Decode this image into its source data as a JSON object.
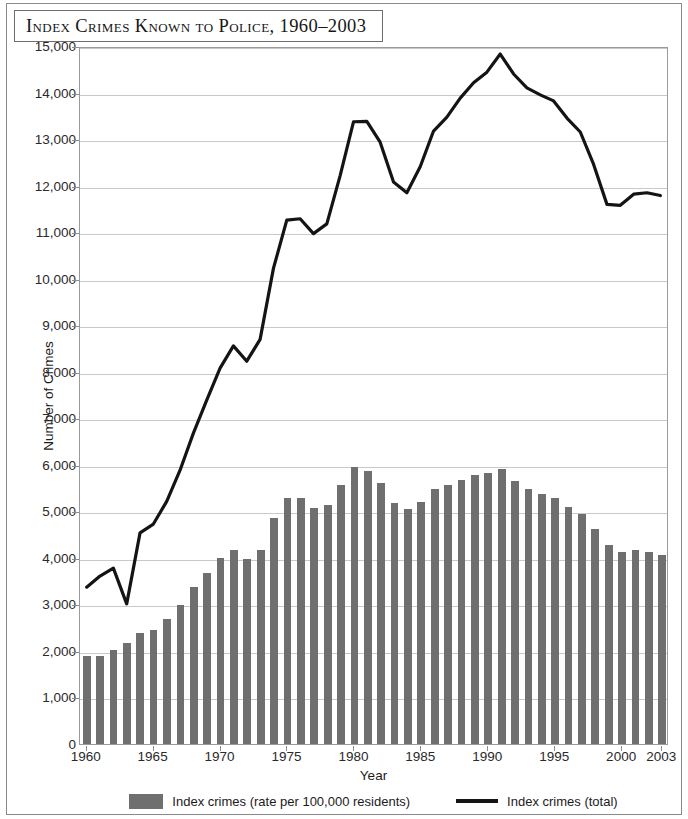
{
  "page": {
    "title": "Index Crimes Known to Police, 1960–2003"
  },
  "legend": {
    "bar_label": "Index crimes (rate per 100,000 residents)",
    "line_label": "Index crimes (total)"
  },
  "axes": {
    "ylabel": "Number of Crimes",
    "xlabel": "Year",
    "ytick_labels": [
      "0",
      "1,000",
      "2,000",
      "3,000",
      "4,000",
      "5,000",
      "6,000",
      "7,000",
      "8,000",
      "9,000",
      "10,000",
      "11,000",
      "12,000",
      "13,000",
      "14,000",
      "15,000"
    ],
    "xtick_labels": [
      "1960",
      "1965",
      "1970",
      "1975",
      "1980",
      "1985",
      "1990",
      "1995",
      "2000",
      "2003"
    ]
  },
  "colors": {
    "bar": "#706f6f",
    "line": "#141414",
    "grid": "#c9c9c9",
    "frame": "#9b9b9b",
    "page_border": "#8a8a8a"
  },
  "chart_data": {
    "type": "bar",
    "title": "Index Crimes Known to Police, 1960–2003",
    "xlabel": "Year",
    "ylabel": "Number of Crimes",
    "ylim": [
      0,
      15000
    ],
    "ytick_step": 1000,
    "grid": true,
    "legend_position": "bottom",
    "categories": [
      1960,
      1961,
      1962,
      1963,
      1964,
      1965,
      1966,
      1967,
      1968,
      1969,
      1970,
      1971,
      1972,
      1973,
      1974,
      1975,
      1976,
      1977,
      1978,
      1979,
      1980,
      1981,
      1982,
      1983,
      1984,
      1985,
      1986,
      1987,
      1988,
      1989,
      1990,
      1991,
      1992,
      1993,
      1994,
      1995,
      1996,
      1997,
      1998,
      1999,
      2000,
      2001,
      2002,
      2003
    ],
    "series": [
      {
        "name": "Index crimes (rate per 100,000 residents)",
        "type": "bar",
        "values": [
          1890,
          1900,
          2030,
          2180,
          2390,
          2450,
          2680,
          2990,
          3380,
          3680,
          3990,
          4170,
          3970,
          4160,
          4860,
          5290,
          5290,
          5080,
          5140,
          5570,
          5950,
          5860,
          5600,
          5180,
          5040,
          5210,
          5490,
          5560,
          5680,
          5780,
          5820,
          5900,
          5660,
          5490,
          5380,
          5280,
          5090,
          4940,
          4620,
          4270,
          4130,
          4160,
          4120,
          4060
        ]
      },
      {
        "name": "Index crimes (total)",
        "type": "line",
        "values": [
          3380,
          3620,
          3790,
          3020,
          4550,
          4740,
          5230,
          5900,
          6700,
          7410,
          8100,
          8580,
          8250,
          8720,
          10250,
          11290,
          11320,
          11000,
          11210,
          12250,
          13410,
          13420,
          12970,
          12110,
          11880,
          12440,
          13210,
          13510,
          13920,
          14250,
          14480,
          14870,
          14440,
          14140,
          13990,
          13860,
          13490,
          13190,
          12490,
          11630,
          11610,
          11850,
          11880,
          11820
        ]
      }
    ]
  }
}
